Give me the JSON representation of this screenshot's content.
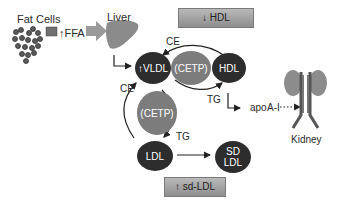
{
  "fat_cells": {
    "label": "Fat Cells"
  },
  "ffa": {
    "label": "↑FFA"
  },
  "liver": {
    "label": "Liver"
  },
  "hdl_box": {
    "label": "↓  HDL"
  },
  "sdldl_box": {
    "label": "↑ sd-LDL"
  },
  "nodes": {
    "vldl": "↑VLDL",
    "cetp_top": "(CETP)",
    "hdl": "HDL",
    "cetp_left": "(CETP)",
    "ldl": "LDL",
    "sd_ldl_line1": "SD",
    "sd_ldl_line2": "LDL"
  },
  "edge_labels": {
    "ce_top": "CE",
    "tg_top": "TG",
    "ce_left": "CE",
    "tg_left": "TG",
    "apo": "apo",
    "a1": "A-I"
  },
  "kidney": {
    "label": "Kidney"
  },
  "colors": {
    "dark_node": "#2d2d2d",
    "cetp_node": "#7c7c7c",
    "box_fill": "#a3a3a3"
  }
}
